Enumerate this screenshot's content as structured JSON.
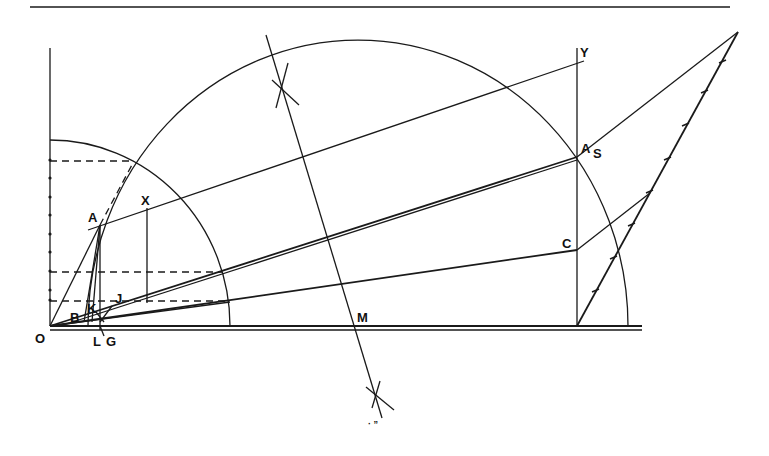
{
  "diagram": {
    "type": "geometric-construction",
    "labels": {
      "O": "O",
      "A": "A",
      "X": "X",
      "B": "B",
      "K": "K",
      "J": "J",
      "L": "L",
      "G": "G",
      "M": "M",
      "Y": "Y",
      "A2": "A",
      "S": "S",
      "C": "C",
      "bottom_mark": "· ”"
    },
    "colors": {
      "ink": "#1a1a1a",
      "paper": "#ffffff"
    },
    "elements": [
      "top-rule",
      "vertical-axis-with-ticks",
      "baseline-double",
      "small-quarter-circle",
      "large-semicircle",
      "perpendicular-bisector-with-arc-marks",
      "line-A-to-Y",
      "radial-lines-from-O",
      "vertical-line-at-A",
      "vertical-line-X",
      "vertical-line-Y",
      "dashed-horizontal-projections",
      "divided-scale-line",
      "construction-line-S",
      "construction-line-C"
    ]
  }
}
